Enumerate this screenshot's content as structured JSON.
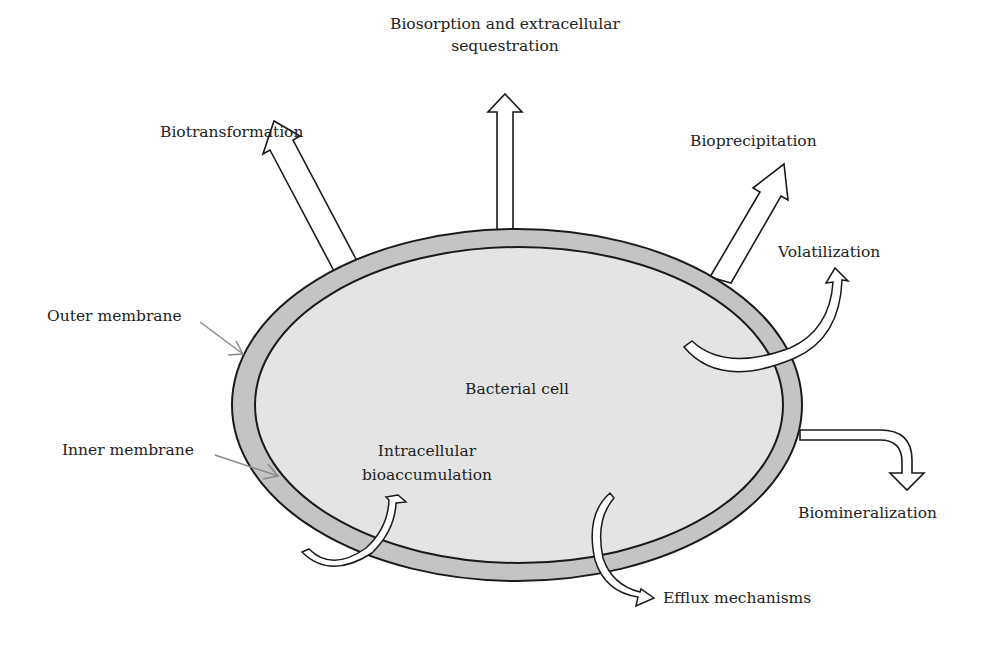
{
  "diagram": {
    "cell_label": "Bacterial cell",
    "labels": {
      "biosorption_line1": "Biosorption and extracellular",
      "biosorption_line2": "sequestration",
      "biotransformation": "Biotransformation",
      "bioprecipitation": "Bioprecipitation",
      "volatilization": "Volatilization",
      "outer_membrane": "Outer membrane",
      "inner_membrane": "Inner membrane",
      "intracellular_line1": "Intracellular",
      "intracellular_line2": "bioaccumulation",
      "biomineralization": "Biomineralization",
      "efflux": "Efflux mechanisms"
    },
    "colors": {
      "membrane_fill": "#c4c4c4",
      "cytoplasm_fill": "#e4e4e4",
      "outline": "#1a1a1a",
      "pointer": "#8a8a8a",
      "arrow_fill": "#ffffff"
    }
  }
}
